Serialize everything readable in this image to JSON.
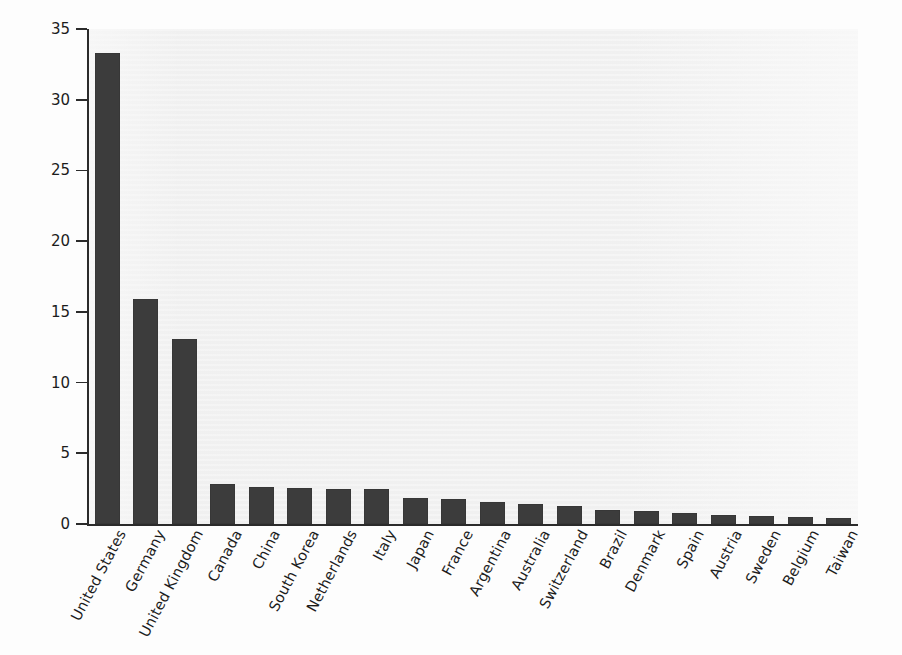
{
  "chart_data": {
    "type": "bar",
    "title": "",
    "xlabel": "",
    "ylabel": "Percentage of total registered domains",
    "ylim": [
      0,
      35
    ],
    "yticks": [
      0,
      5,
      10,
      15,
      20,
      25,
      30,
      35
    ],
    "ytick_labels": [
      "0",
      "5",
      "10",
      "15",
      "20",
      "25",
      "30",
      "35"
    ],
    "grid": false,
    "legend": null,
    "bar_color": "#3c3c3c",
    "plot_background": "#f2f2f2",
    "categories": [
      "United States",
      "Germany",
      "United Kingdom",
      "Canada",
      "China",
      "South Korea",
      "Netherlands",
      "Italy",
      "Japan",
      "France",
      "Argentina",
      "Australia",
      "Switzerland",
      "Brazil",
      "Denmark",
      "Spain",
      "Austria",
      "Sweden",
      "Belgium",
      "Taiwan"
    ],
    "values": [
      33.3,
      15.9,
      13.1,
      2.8,
      2.6,
      2.55,
      2.45,
      2.45,
      1.85,
      1.75,
      1.55,
      1.4,
      1.3,
      1.0,
      0.9,
      0.75,
      0.65,
      0.55,
      0.5,
      0.4
    ]
  }
}
